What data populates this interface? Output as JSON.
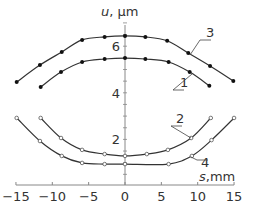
{
  "chart_data": {
    "type": "line",
    "title": "",
    "xlabel": "s, mm",
    "ylabel": "u, µm",
    "xlabel_var": "s",
    "xlabel_unit": ",mm",
    "ylabel_var": "u",
    "ylabel_unit": ", µm",
    "xlim": [
      -15,
      15
    ],
    "ylim": [
      0,
      7
    ],
    "xticks": [
      -15,
      -10,
      -5,
      0,
      5,
      10,
      15
    ],
    "xtick_labels": [
      "−15",
      "−10",
      "−5",
      "0",
      "5",
      "10",
      "15"
    ],
    "yticks": [
      2,
      4,
      6
    ],
    "ytick_labels": [
      "2",
      "4",
      "6"
    ],
    "grid": false,
    "legend": "inline curve labels with leader lines",
    "series": [
      {
        "name": "1",
        "marker": "filled",
        "x": [
          -11.6,
          -8.8,
          -5.9,
          -2.8,
          0,
          2.8,
          6.0,
          8.9,
          11.6
        ],
        "y": [
          4.25,
          4.89,
          5.32,
          5.45,
          5.49,
          5.45,
          5.32,
          4.89,
          4.3
        ]
      },
      {
        "name": "2",
        "marker": "open",
        "x": [
          -11.6,
          -8.8,
          -5.9,
          -2.8,
          0,
          3.0,
          5.9,
          9.1,
          11.8
        ],
        "y": [
          2.92,
          2.06,
          1.55,
          1.37,
          1.29,
          1.37,
          1.55,
          2.06,
          2.92
        ]
      },
      {
        "name": "3",
        "marker": "filled",
        "x": [
          -14.9,
          -11.7,
          -8.7,
          -5.9,
          -2.8,
          0,
          2.8,
          5.8,
          8.7,
          11.7,
          14.9
        ],
        "y": [
          4.46,
          5.19,
          5.75,
          6.27,
          6.4,
          6.44,
          6.4,
          6.23,
          5.71,
          5.15,
          4.51
        ]
      },
      {
        "name": "4",
        "marker": "open",
        "x": [
          -14.9,
          -11.7,
          -8.7,
          -5.9,
          -2.8,
          0,
          6.0,
          9.2,
          11.9,
          15.0
        ],
        "y": [
          2.92,
          1.93,
          1.29,
          0.99,
          0.94,
          0.94,
          0.94,
          1.29,
          1.97,
          2.92
        ]
      }
    ],
    "annotations": [
      {
        "text": "1",
        "series": "1"
      },
      {
        "text": "2",
        "series": "2"
      },
      {
        "text": "3",
        "series": "3"
      },
      {
        "text": "4",
        "series": "4"
      }
    ]
  },
  "style": {
    "line_color": "#333333",
    "axis_color": "#888888",
    "marker_fill": "#111111",
    "open_marker_fill": "#ffffff"
  }
}
